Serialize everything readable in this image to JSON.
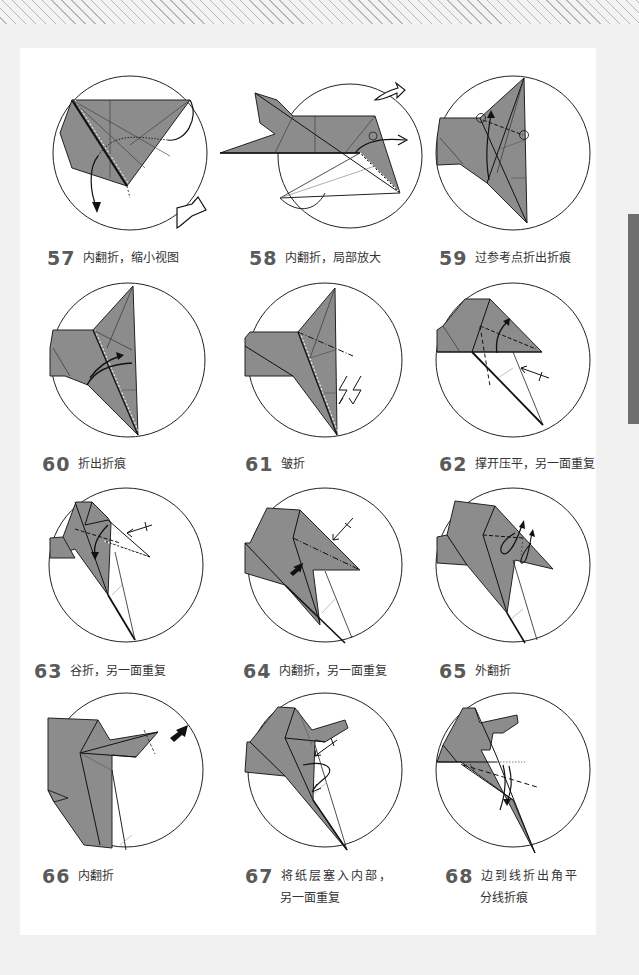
{
  "page": {
    "background": "#f1f1f1",
    "paper_color": "#ffffff",
    "fold_gray": "#8c8c8c",
    "side_tab_color": "#6e6e6e"
  },
  "steps": [
    {
      "num": "57",
      "text": "内翻折，缩小视图",
      "symbols": [
        "inside-reverse-fold",
        "zoom-out-arrow"
      ]
    },
    {
      "num": "58",
      "text": "内翻折，局部放大",
      "symbols": [
        "inside-reverse-fold",
        "zoom-in-arrow"
      ]
    },
    {
      "num": "59",
      "text": "过参考点折出折痕",
      "symbols": [
        "reference-point",
        "valley-fold-crease"
      ]
    },
    {
      "num": "60",
      "text": "折出折痕",
      "symbols": [
        "crease-arrow"
      ]
    },
    {
      "num": "61",
      "text": "皱折",
      "symbols": [
        "crimp-fold",
        "zigzag-arrow"
      ]
    },
    {
      "num": "62",
      "text": "撑开压平，另一面重复",
      "symbols": [
        "squash-fold",
        "repeat-behind"
      ]
    },
    {
      "num": "63",
      "text": "谷折，另一面重复",
      "symbols": [
        "valley-fold",
        "repeat-behind"
      ]
    },
    {
      "num": "64",
      "text": "内翻折，另一面重复",
      "symbols": [
        "push-arrow",
        "repeat-behind"
      ]
    },
    {
      "num": "65",
      "text": "外翻折",
      "symbols": [
        "outside-reverse-fold"
      ]
    },
    {
      "num": "66",
      "text": "内翻折",
      "symbols": [
        "push-arrow"
      ]
    },
    {
      "num": "67",
      "text": "将纸层塞入内部，",
      "text2": "另一面重复",
      "symbols": [
        "tuck-arrow",
        "repeat-behind"
      ]
    },
    {
      "num": "68",
      "text": "边到线折出角平",
      "text2": "分线折痕",
      "symbols": [
        "angle-bisector-crease"
      ]
    }
  ]
}
